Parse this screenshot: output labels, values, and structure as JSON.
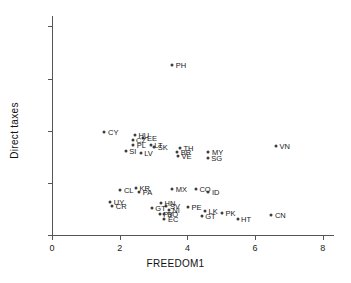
{
  "chart_data": {
    "type": "scatter",
    "title": "",
    "xlabel": "FREEDOM1",
    "ylabel": "Direct taxes",
    "xlim": [
      0,
      8.3
    ],
    "ylim": [
      0,
      21
    ],
    "xticks": [
      0,
      2,
      4,
      6,
      8
    ],
    "yticks": [
      0,
      5,
      10,
      15,
      20
    ],
    "grid": false,
    "legend": null,
    "point_color": "#3d3d3d",
    "axis_color": "#555555",
    "points": [
      {
        "label": "PH",
        "x": 3.55,
        "y": 16.3
      },
      {
        "label": "CY",
        "x": 1.55,
        "y": 9.85
      },
      {
        "label": "HU",
        "x": 2.45,
        "y": 9.55
      },
      {
        "label": "EE",
        "x": 2.7,
        "y": 9.3
      },
      {
        "label": "CZ",
        "x": 2.38,
        "y": 9.15
      },
      {
        "label": "PL",
        "x": 2.4,
        "y": 8.65
      },
      {
        "label": "LT",
        "x": 2.92,
        "y": 8.6
      },
      {
        "label": "SK",
        "x": 3.02,
        "y": 8.4
      },
      {
        "label": "SI",
        "x": 2.18,
        "y": 8.05
      },
      {
        "label": "LV",
        "x": 2.62,
        "y": 7.85
      },
      {
        "label": "TH",
        "x": 3.78,
        "y": 8.35
      },
      {
        "label": "BR",
        "x": 3.7,
        "y": 8.0
      },
      {
        "label": "VE",
        "x": 3.72,
        "y": 7.55
      },
      {
        "label": "MY",
        "x": 4.62,
        "y": 7.95
      },
      {
        "label": "SG",
        "x": 4.6,
        "y": 7.4
      },
      {
        "label": "CL",
        "x": 2.02,
        "y": 4.35
      },
      {
        "label": "KR",
        "x": 2.48,
        "y": 4.55
      },
      {
        "label": "PA",
        "x": 2.58,
        "y": 4.15
      },
      {
        "label": "MX",
        "x": 3.55,
        "y": 4.4
      },
      {
        "label": "CO",
        "x": 4.25,
        "y": 4.45
      },
      {
        "label": "ID",
        "x": 4.62,
        "y": 4.1
      },
      {
        "label": "UY",
        "x": 1.72,
        "y": 3.15
      },
      {
        "label": "CR",
        "x": 1.78,
        "y": 2.75
      },
      {
        "label": "HN",
        "x": 3.22,
        "y": 3.05
      },
      {
        "label": "SV",
        "x": 3.38,
        "y": 2.75
      },
      {
        "label": "GT2",
        "x": 2.95,
        "y": 2.6
      },
      {
        "label": "NI",
        "x": 3.45,
        "y": 2.4
      },
      {
        "label": "PY",
        "x": 3.18,
        "y": 2.05
      },
      {
        "label": "BO",
        "x": 3.3,
        "y": 2.0
      },
      {
        "label": "EC",
        "x": 3.32,
        "y": 1.55
      },
      {
        "label": "PE",
        "x": 4.02,
        "y": 2.7
      },
      {
        "label": "LK",
        "x": 4.52,
        "y": 2.3
      },
      {
        "label": "GT",
        "x": 4.42,
        "y": 1.8
      },
      {
        "label": "PK",
        "x": 5.02,
        "y": 2.1
      },
      {
        "label": "HT",
        "x": 5.48,
        "y": 1.55
      },
      {
        "label": "CN",
        "x": 6.48,
        "y": 1.95
      },
      {
        "label": "VN",
        "x": 6.62,
        "y": 8.55
      }
    ]
  },
  "axes": {
    "x_tick_labels": [
      "0",
      "2",
      "4",
      "6",
      "8"
    ],
    "y_tick_labels": [
      "0",
      "5",
      "10",
      "15",
      "20"
    ],
    "x_title": "FREEDOM1",
    "y_title": "Direct taxes"
  }
}
